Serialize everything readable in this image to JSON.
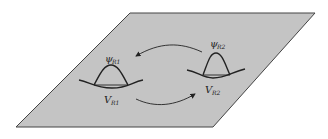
{
  "diagram": {
    "plane_color": "#c4c4c4",
    "plane_edge_color": "#444444",
    "line_color": "#222222",
    "left_well": {
      "wavefunction_label": "ψ",
      "wavefunction_subscript": "R1",
      "potential_label": "V",
      "potential_subscript": "R1"
    },
    "right_well": {
      "wavefunction_label": "ψ",
      "wavefunction_subscript": "R2",
      "potential_label": "V",
      "potential_subscript": "R2"
    },
    "arrows": [
      {
        "from": "right_well",
        "to": "left_well",
        "position": "top"
      },
      {
        "from": "left_well",
        "to": "right_well",
        "position": "bottom"
      }
    ]
  }
}
